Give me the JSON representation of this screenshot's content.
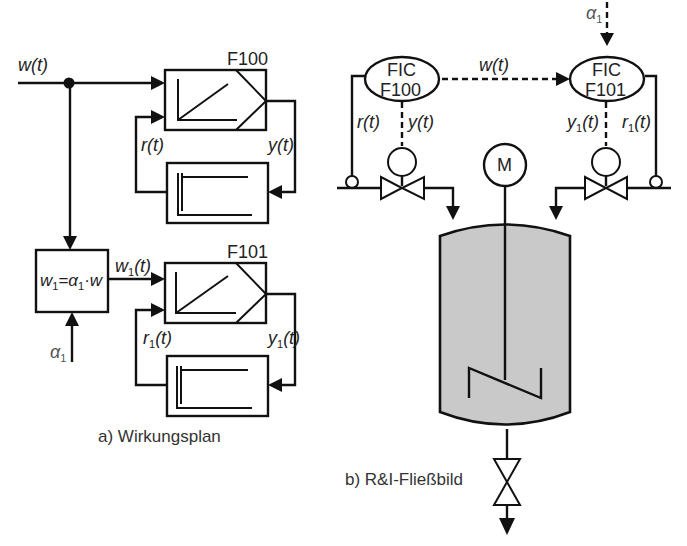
{
  "figure": {
    "part_a": {
      "caption": "a) Wirkungsplan",
      "input_signal": "w(t)",
      "controller_1": {
        "tag": "F100",
        "feedback": "r(t)",
        "output": "y(t)"
      },
      "ratio_block": {
        "formula_lhs": "w",
        "formula_lhs_sub": "1",
        "formula_eq": "=",
        "formula_alpha": "α",
        "formula_alpha_sub": "1",
        "formula_dot": "·",
        "formula_rhs": "w",
        "input_alpha": "α",
        "input_alpha_sub": "1",
        "output": "w",
        "output_sub": "1",
        "output_suffix": "(t)"
      },
      "controller_2": {
        "tag": "F101",
        "feedback_base": "r",
        "feedback_sub": "1",
        "feedback_suffix": "(t)",
        "output_base": "y",
        "output_sub": "1",
        "output_suffix": "(t)"
      }
    },
    "part_b": {
      "caption": "b) R&I-Fließbild",
      "alpha_input": "α",
      "alpha_sub": "1",
      "setpoint_signal": "w(t)",
      "controller_1": {
        "line1": "FIC",
        "line2": "F100",
        "feedback": "r(t)",
        "output": "y(t)"
      },
      "controller_2": {
        "line1": "FIC",
        "line2": "F101",
        "feedback_base": "r",
        "feedback_sub": "1",
        "feedback_suffix": "(t)",
        "output_base": "y",
        "output_sub": "1",
        "output_suffix": "(t)"
      },
      "motor_label": "M"
    }
  },
  "colors": {
    "line": "#111111",
    "tank_fill": "#c9c9c9",
    "background": "#ffffff"
  }
}
